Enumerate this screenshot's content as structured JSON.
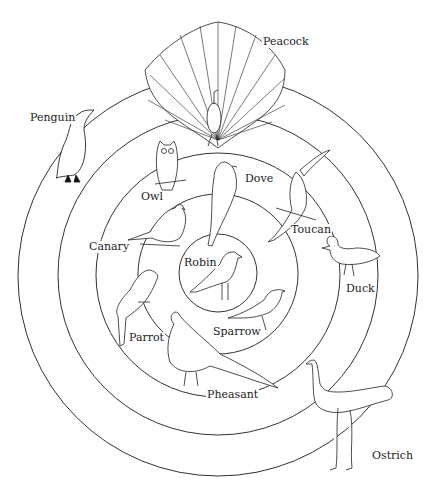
{
  "diagram": {
    "type": "concentric-circles",
    "center": {
      "x": 218,
      "y": 274
    },
    "rings": [
      {
        "level": 1,
        "radius": 40,
        "birds": [
          "Robin"
        ]
      },
      {
        "level": 2,
        "radius": 80,
        "birds": [
          "Dove",
          "Sparrow"
        ]
      },
      {
        "level": 3,
        "radius": 122,
        "birds": [
          "Owl",
          "Canary",
          "Parrot",
          "Toucan",
          "Pheasant"
        ]
      },
      {
        "level": 4,
        "radius": 160,
        "birds": [
          "Duck",
          "Peacock"
        ]
      },
      {
        "level": 5,
        "radius": 200,
        "birds": [
          "Penguin",
          "Ostrich"
        ]
      }
    ],
    "labels": {
      "peacock": "Peacock",
      "penguin": "Penguin",
      "owl": "Owl",
      "dove": "Dove",
      "toucan": "Toucan",
      "canary": "Canary",
      "robin": "Robin",
      "duck": "Duck",
      "sparrow": "Sparrow",
      "parrot": "Parrot",
      "pheasant": "Pheasant",
      "ostrich": "Ostrich"
    }
  }
}
